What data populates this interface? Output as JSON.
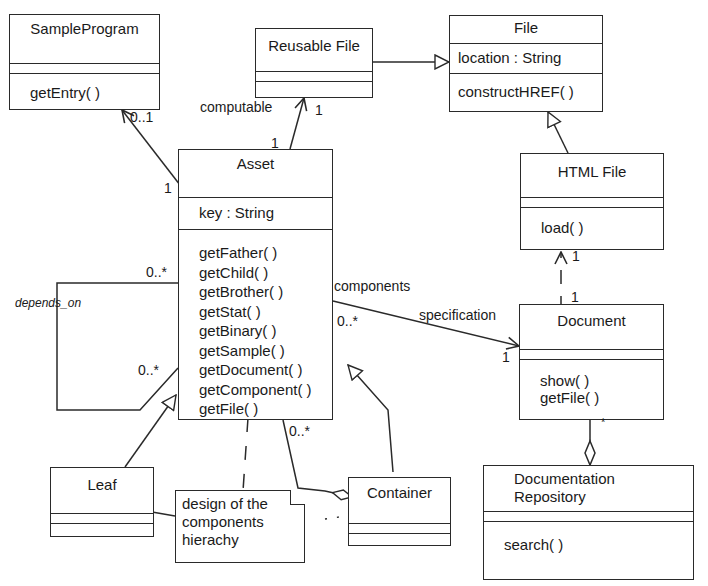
{
  "classes": {
    "sample_program": {
      "name": "SampleProgram",
      "attributes": [],
      "operations": [
        "getEntry( )"
      ]
    },
    "reusable_file": {
      "name": "Reusable File",
      "attributes": [],
      "operations": []
    },
    "file": {
      "name": "File",
      "attributes": [
        "location : String"
      ],
      "operations": [
        "constructHREF( )"
      ]
    },
    "asset": {
      "name": "Asset",
      "attributes": [
        "key : String"
      ],
      "operations": [
        "getFather( )",
        "getChild( )",
        "getBrother( )",
        "getStat( )",
        "getBinary( )",
        "getSample( )",
        "getDocument( )",
        "getComponent( )",
        "getFile( )"
      ]
    },
    "html_file": {
      "name": "HTML File",
      "attributes": [],
      "operations": [
        "load( )"
      ]
    },
    "document": {
      "name": "Document",
      "attributes": [],
      "operations": [
        "show( )",
        "getFile( )"
      ]
    },
    "leaf": {
      "name": "Leaf",
      "attributes": [],
      "operations": []
    },
    "container": {
      "name": "Container",
      "attributes": [],
      "operations": []
    },
    "documentation_repository": {
      "name": "Documentation Repository",
      "name_lines": [
        "Documentation",
        "Repository"
      ],
      "attributes": [],
      "operations": [
        "search( )"
      ]
    }
  },
  "note": {
    "lines": [
      "design of the",
      "components",
      "hierachy"
    ]
  },
  "labels": {
    "sample_mult_target": "0..1",
    "sample_mult_source": "1",
    "computable": "computable",
    "reusable_mult_target": "1",
    "reusable_mult_source": "1",
    "depends_on": "depends_on",
    "depends_mult_top": "0..*",
    "depends_mult_bottom": "0..*",
    "components": "components",
    "components_mult": "0..*",
    "specification": "specification",
    "spec_mult": "1",
    "htmlfile_mult": "1",
    "document_top_mult": "1",
    "document_star": "*",
    "container_mult": "0..*"
  }
}
